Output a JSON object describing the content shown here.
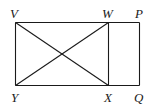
{
  "figure": {
    "type": "geometry",
    "points": {
      "V": {
        "label": "V",
        "x": 15.5,
        "y": 22.5
      },
      "W": {
        "label": "W",
        "x": 108.5,
        "y": 22.5
      },
      "P": {
        "label": "P",
        "x": 139.5,
        "y": 22.5
      },
      "Y": {
        "label": "Y",
        "x": 15.5,
        "y": 85.5
      },
      "X": {
        "label": "X",
        "x": 108.5,
        "y": 85.5
      },
      "Q": {
        "label": "Q",
        "x": 139.5,
        "y": 85.5
      }
    },
    "segments": [
      [
        "V",
        "P"
      ],
      [
        "Y",
        "Q"
      ],
      [
        "V",
        "Y"
      ],
      [
        "W",
        "X"
      ],
      [
        "P",
        "Q"
      ],
      [
        "V",
        "X"
      ],
      [
        "W",
        "Y"
      ]
    ],
    "labels": {
      "V": "V",
      "W": "W",
      "P": "P",
      "Y": "Y",
      "X": "X",
      "Q": "Q"
    },
    "line_color": "#1a1a1a"
  }
}
